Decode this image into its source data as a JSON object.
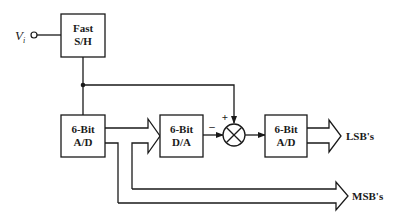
{
  "diagram": {
    "type": "block-diagram",
    "input": {
      "label": "V",
      "subscript": "i"
    },
    "blocks": [
      {
        "id": "sh",
        "line1": "Fast",
        "line2": "S/H"
      },
      {
        "id": "adc1",
        "line1": "6-Bit",
        "line2": "A/D"
      },
      {
        "id": "dac",
        "line1": "6-Bit",
        "line2": "D/A"
      },
      {
        "id": "adc2",
        "line1": "6-Bit",
        "line2": "A/D"
      }
    ],
    "summer": {
      "plus": "+",
      "minus": "–"
    },
    "outputs": {
      "lsb": "LSB's",
      "msb": "MSB's"
    },
    "connections": [
      {
        "from": "input",
        "to": "sh"
      },
      {
        "from": "sh",
        "to": "adc1"
      },
      {
        "from": "sh",
        "to": "summer",
        "sign": "+"
      },
      {
        "from": "adc1",
        "to": "dac",
        "style": "bus"
      },
      {
        "from": "dac",
        "to": "summer",
        "sign": "-"
      },
      {
        "from": "summer",
        "to": "adc2"
      },
      {
        "from": "adc2",
        "to": "lsb_output",
        "style": "bus"
      },
      {
        "from": "adc1",
        "to": "msb_output",
        "style": "bus"
      }
    ]
  }
}
